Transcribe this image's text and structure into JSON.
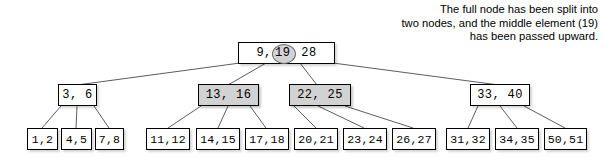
{
  "diagram": {
    "caption": "The full node has been split into\ntwo nodes, and the middle element (19)\nhas been passed upward.",
    "colors": {
      "highlight_fill": "#d2d2d2",
      "node_fill": "#ffffff",
      "border": "#000000",
      "text": "#000000",
      "circle_stroke": "#6d6d6d"
    },
    "root": {
      "label": "9, 19, 28",
      "keys": [
        "9",
        "19",
        "28"
      ],
      "separator_after_first": ",",
      "circled_key": "19",
      "highlighted": false
    },
    "level2": [
      {
        "label": "3, 6",
        "keys": [
          "3",
          "6"
        ],
        "highlighted": false
      },
      {
        "label": "13, 16",
        "keys": [
          "13",
          "16"
        ],
        "highlighted": true
      },
      {
        "label": "22, 25",
        "keys": [
          "22",
          "25"
        ],
        "highlighted": true
      },
      {
        "label": "33, 40",
        "keys": [
          "33",
          "40"
        ],
        "highlighted": false
      }
    ],
    "leaves": [
      {
        "label": "1,2"
      },
      {
        "label": "4,5"
      },
      {
        "label": "7,8"
      },
      {
        "label": "11,12"
      },
      {
        "label": "14,15"
      },
      {
        "label": "17,18"
      },
      {
        "label": "20,21"
      },
      {
        "label": "23,24"
      },
      {
        "label": "26,27"
      },
      {
        "label": "31,32"
      },
      {
        "label": "34,35"
      },
      {
        "label": "50,51"
      }
    ]
  }
}
